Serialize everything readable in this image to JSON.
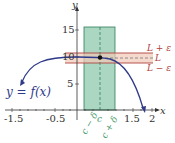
{
  "diagram": {
    "axes": {
      "x_label": "x",
      "y_label": "y",
      "x_ticks": [
        "-1.5",
        "-0.5",
        "1.5",
        "2"
      ],
      "y_ticks": [
        "15",
        "10",
        "5"
      ]
    },
    "function_label": "y = f(x)",
    "epsilon_labels": {
      "upper": "L + ε",
      "center": "L",
      "lower": "L − ε"
    },
    "delta_labels": {
      "left": "c − δ",
      "center": "c",
      "right": "c + δ"
    },
    "colors": {
      "curve": "#2f3a8a",
      "delta_band": "#8fc9ad",
      "delta_border": "#2e7d5b",
      "epsilon_band": "#f1c9b8",
      "epsilon_border": "#b0413e",
      "epsilon_text": "#b0413e",
      "delta_text": "#4a9a6a",
      "axis": "#333333"
    }
  }
}
